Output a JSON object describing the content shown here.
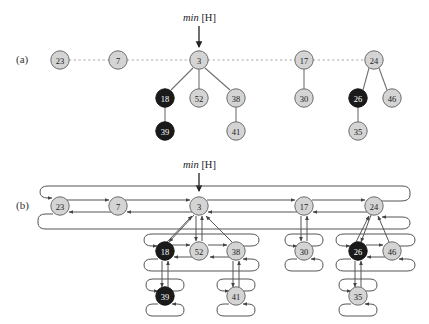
{
  "figure": {
    "type": "fibonacci-heap-diagram",
    "panels": [
      {
        "id": "a",
        "label": "(a)",
        "min_label_prefix": "min",
        "min_label_arg": "[H]"
      },
      {
        "id": "b",
        "label": "(b)",
        "min_label_prefix": "min",
        "min_label_arg": "[H]"
      }
    ],
    "colors": {
      "gray_node_fill": "#d4d4d4",
      "black_node_fill": "#1a1a1a",
      "gray_node_text": "#1a1a1a",
      "black_node_text": "#ffffff",
      "stroke": "#6b6b6b",
      "dashed_stroke": "#9a9a9a",
      "pointer_stroke": "#555555",
      "background": "#ffffff"
    },
    "node_radius": 9.2
  },
  "nodes": {
    "a": [
      {
        "key": "23",
        "marked": false,
        "x": 60,
        "y": 60
      },
      {
        "key": "7",
        "marked": false,
        "x": 118,
        "y": 60
      },
      {
        "key": "3",
        "marked": false,
        "x": 199,
        "y": 60
      },
      {
        "key": "17",
        "marked": false,
        "x": 304,
        "y": 60
      },
      {
        "key": "24",
        "marked": false,
        "x": 374,
        "y": 60
      },
      {
        "key": "18",
        "marked": true,
        "x": 165,
        "y": 98
      },
      {
        "key": "52",
        "marked": false,
        "x": 199,
        "y": 98
      },
      {
        "key": "38",
        "marked": false,
        "x": 236,
        "y": 98
      },
      {
        "key": "30",
        "marked": false,
        "x": 304,
        "y": 98
      },
      {
        "key": "26",
        "marked": true,
        "x": 358,
        "y": 98
      },
      {
        "key": "46",
        "marked": false,
        "x": 392,
        "y": 98
      },
      {
        "key": "39",
        "marked": true,
        "x": 165,
        "y": 131
      },
      {
        "key": "41",
        "marked": false,
        "x": 236,
        "y": 131
      },
      {
        "key": "35",
        "marked": false,
        "x": 358,
        "y": 131
      }
    ],
    "b": [
      {
        "key": "23",
        "marked": false,
        "x": 60,
        "y": 206
      },
      {
        "key": "7",
        "marked": false,
        "x": 118,
        "y": 206
      },
      {
        "key": "3",
        "marked": false,
        "x": 199,
        "y": 206
      },
      {
        "key": "17",
        "marked": false,
        "x": 304,
        "y": 206
      },
      {
        "key": "24",
        "marked": false,
        "x": 374,
        "y": 206
      },
      {
        "key": "18",
        "marked": true,
        "x": 165,
        "y": 251
      },
      {
        "key": "52",
        "marked": false,
        "x": 199,
        "y": 251
      },
      {
        "key": "38",
        "marked": false,
        "x": 236,
        "y": 251
      },
      {
        "key": "30",
        "marked": false,
        "x": 304,
        "y": 251
      },
      {
        "key": "26",
        "marked": true,
        "x": 358,
        "y": 251
      },
      {
        "key": "46",
        "marked": false,
        "x": 392,
        "y": 251
      },
      {
        "key": "39",
        "marked": true,
        "x": 165,
        "y": 296
      },
      {
        "key": "41",
        "marked": false,
        "x": 236,
        "y": 296
      },
      {
        "key": "35",
        "marked": false,
        "x": 358,
        "y": 296
      }
    ]
  },
  "root_list": [
    "23",
    "7",
    "3",
    "17",
    "24"
  ],
  "tree_edges_a": [
    [
      "3",
      "18"
    ],
    [
      "3",
      "52"
    ],
    [
      "3",
      "38"
    ],
    [
      "18",
      "39"
    ],
    [
      "38",
      "41"
    ],
    [
      "17",
      "30"
    ],
    [
      "24",
      "26"
    ],
    [
      "24",
      "46"
    ],
    [
      "26",
      "35"
    ]
  ],
  "child_lists": [
    {
      "parent": "3",
      "children": [
        "18",
        "52",
        "38"
      ]
    },
    {
      "parent": "17",
      "children": [
        "30"
      ]
    },
    {
      "parent": "24",
      "children": [
        "26",
        "46"
      ]
    },
    {
      "parent": "18",
      "children": [
        "39"
      ]
    },
    {
      "parent": "38",
      "children": [
        "41"
      ]
    },
    {
      "parent": "26",
      "children": [
        "35"
      ]
    }
  ],
  "caption_texts": {
    "min_pointer_a": "min [H]",
    "min_pointer_b": "min [H]"
  }
}
